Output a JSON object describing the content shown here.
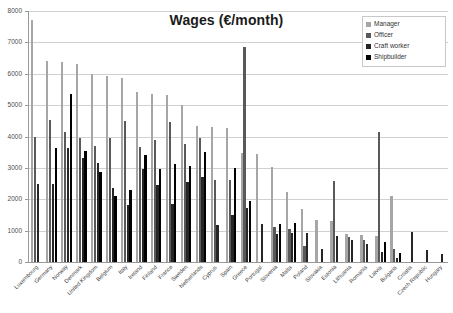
{
  "chart_data": {
    "type": "bar",
    "title": "Wages (€/month)",
    "xlabel": "",
    "ylabel": "",
    "ylim": [
      0,
      8000
    ],
    "ytick_step": 1000,
    "yticks": [
      "0",
      "1000",
      "2000",
      "3000",
      "4000",
      "5000",
      "6000",
      "7000",
      "8000"
    ],
    "grid": true,
    "legend_position": "top-right",
    "categories": [
      "Luxembourg",
      "Germany",
      "Norway",
      "Denmark",
      "United Kingdom",
      "Belgium",
      "Italy",
      "Ireland",
      "Finland",
      "France",
      "Sweden",
      "Netherlands",
      "Cyprus",
      "Spain",
      "Greece",
      "Portugal",
      "Slovenia",
      "Malta",
      "Poland",
      "Slovakia",
      "Estonia",
      "Lithuania",
      "Romania",
      "Latvia",
      "Bulgaria",
      "Croatia",
      "Czech Republic",
      "Hungary"
    ],
    "series": [
      {
        "name": "Manager",
        "color": "#a6a6a6",
        "values": [
          7700,
          6420,
          6390,
          6310,
          6000,
          5940,
          5880,
          5430,
          5370,
          5310,
          5020,
          4330,
          4290,
          4270,
          3470,
          3430,
          3030,
          2230,
          1680,
          1340,
          1320,
          890,
          860,
          830,
          2090,
          0,
          0,
          0
        ]
      },
      {
        "name": "Officer",
        "color": "#595959",
        "values": [
          3980,
          4540,
          4150,
          3950,
          3700,
          3940,
          4490,
          3680,
          3880,
          4460,
          3760,
          3940,
          2610,
          2610,
          6840,
          0,
          1120,
          1060,
          520,
          0,
          2590,
          790,
          710,
          4150,
          420,
          0,
          0,
          0
        ]
      },
      {
        "name": "Craft worker",
        "color": "#262626",
        "values": [
          2490,
          2500,
          3630,
          3300,
          3140,
          2350,
          1810,
          2960,
          2450,
          1860,
          2560,
          2700,
          1180,
          1500,
          1720,
          1220,
          900,
          920,
          940,
          430,
          820,
          690,
          560,
          330,
          140,
          950,
          370,
          260
        ]
      },
      {
        "name": "Shipbuilder",
        "color": "#000000",
        "values": [
          0,
          3630,
          5350,
          3550,
          2880,
          2110,
          2290,
          3400,
          2970,
          3120,
          3050,
          3520,
          0,
          2990,
          1940,
          0,
          1200,
          1240,
          0,
          0,
          0,
          0,
          0,
          650,
          300,
          0,
          0,
          0
        ]
      }
    ]
  }
}
